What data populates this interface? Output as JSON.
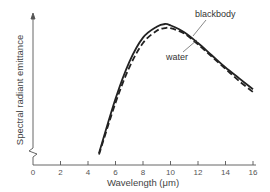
{
  "chart_data": {
    "type": "line",
    "title": "",
    "xlabel": "Wavelength (μm)",
    "ylabel": "Spectral radiant emittance",
    "xlim": [
      0,
      16
    ],
    "x_ticks": [
      "0",
      "2",
      "4",
      "6",
      "8",
      "10",
      "12",
      "14",
      "16"
    ],
    "grid": false,
    "y_axis_break": true,
    "series": [
      {
        "name": "blackbody",
        "style": "solid",
        "x": [
          4.8,
          6,
          7,
          8,
          9,
          9.6,
          10,
          11,
          12,
          13,
          14,
          15,
          16
        ],
        "y": [
          0.05,
          0.45,
          0.72,
          0.9,
          0.98,
          1.0,
          0.99,
          0.94,
          0.86,
          0.77,
          0.68,
          0.6,
          0.52
        ]
      },
      {
        "name": "water",
        "style": "dashed",
        "x": [
          4.8,
          6,
          7,
          8,
          9,
          9.6,
          10,
          11,
          12,
          13,
          14,
          15,
          16
        ],
        "y": [
          0.04,
          0.42,
          0.68,
          0.86,
          0.95,
          0.97,
          0.97,
          0.93,
          0.85,
          0.76,
          0.67,
          0.58,
          0.5
        ]
      }
    ],
    "annotations": [
      "blackbody",
      "water"
    ]
  }
}
